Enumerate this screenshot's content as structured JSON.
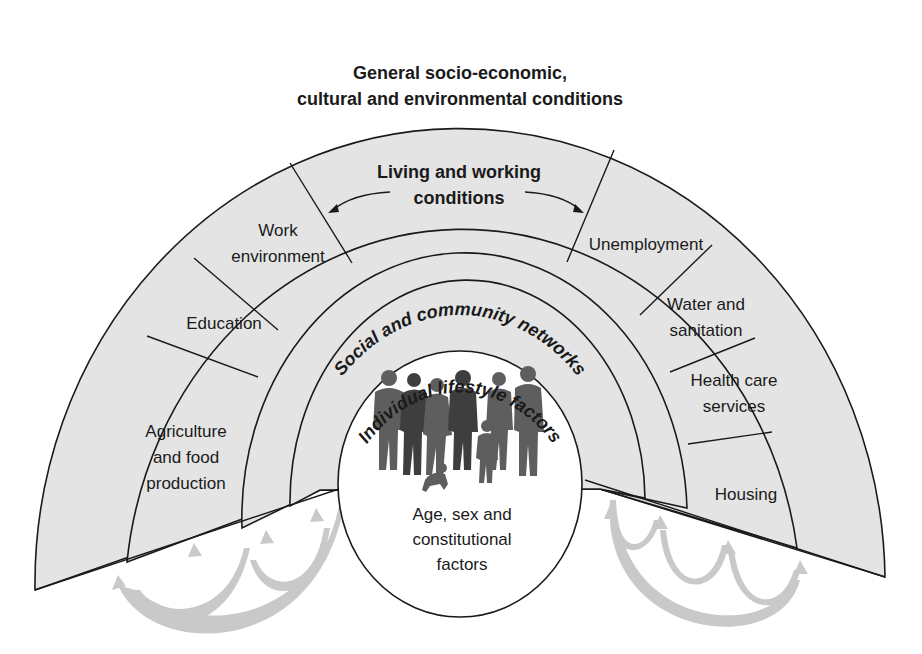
{
  "diagram": {
    "layers": {
      "outer": {
        "line1": "General socio-economic,",
        "line2": "cultural and environmental conditions"
      },
      "living_working": {
        "line1": "Living and working",
        "line2": "conditions",
        "segments": [
          {
            "id": "agriculture",
            "lines": [
              "Agriculture",
              "and food",
              "production"
            ]
          },
          {
            "id": "education",
            "lines": [
              "Education"
            ]
          },
          {
            "id": "work-environment",
            "lines": [
              "Work",
              "environment"
            ]
          },
          {
            "id": "unemployment",
            "lines": [
              "Unemployment"
            ]
          },
          {
            "id": "water-sanitation",
            "lines": [
              "Water and",
              "sanitation"
            ]
          },
          {
            "id": "health-care",
            "lines": [
              "Health care",
              "services"
            ]
          },
          {
            "id": "housing",
            "lines": [
              "Housing"
            ]
          }
        ]
      },
      "social": {
        "label": "Social and community networks"
      },
      "individual": {
        "label": "Individual lifestyle factors"
      },
      "core": {
        "lines": [
          "Age, sex and",
          "constitutional",
          "factors"
        ]
      }
    },
    "colors": {
      "band_fill": "#e4e4e4",
      "stroke": "#1a1a1a",
      "arrow_fill": "#c9c9c9",
      "silhouette": "#5e5e5e",
      "core_fill": "#ffffff"
    }
  }
}
